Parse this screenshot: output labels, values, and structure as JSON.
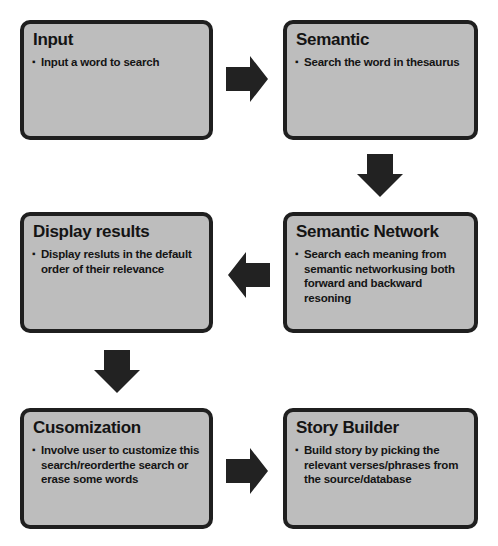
{
  "diagram": {
    "type": "flowchart",
    "colors": {
      "box_fill": "#bdbdbd",
      "box_border": "#1f1f1f",
      "arrow": "#222222",
      "background": "#ffffff"
    },
    "nodes": [
      {
        "id": "input",
        "title": "Input",
        "bullet": "Input a word to search"
      },
      {
        "id": "semantic",
        "title": "Semantic",
        "bullet": "Search the  word in thesaurus"
      },
      {
        "id": "semantic_network",
        "title": "Semantic Network",
        "bullet": "Search each meaning from semantic networkusing both forward and backward resoning"
      },
      {
        "id": "display_results",
        "title": "Display results",
        "bullet": "Display resluts in the default order of their relevance"
      },
      {
        "id": "cusomization",
        "title": "Cusomization",
        "bullet": "Involve user to customize this search/reorderthe search or erase some words"
      },
      {
        "id": "story_builder",
        "title": "Story Builder",
        "bullet": "Build story by picking the relevant verses/phrases from the source/database"
      }
    ],
    "edges": [
      {
        "from": "input",
        "to": "semantic",
        "direction": "right"
      },
      {
        "from": "semantic",
        "to": "semantic_network",
        "direction": "down"
      },
      {
        "from": "semantic_network",
        "to": "display_results",
        "direction": "left"
      },
      {
        "from": "display_results",
        "to": "cusomization",
        "direction": "down"
      },
      {
        "from": "cusomization",
        "to": "story_builder",
        "direction": "right"
      }
    ],
    "bullet_glyph": "▪"
  }
}
